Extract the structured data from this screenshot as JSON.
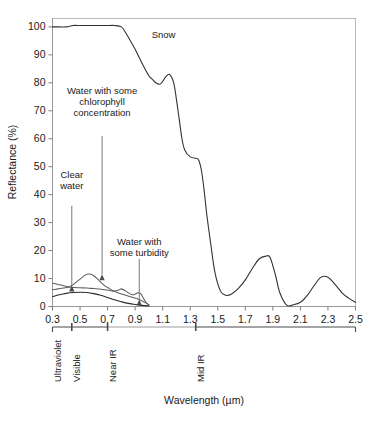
{
  "figure": {
    "background": "#ffffff",
    "ink": "#1a1a1a"
  },
  "axes": {
    "y_title": "Reflectance (%)",
    "x_title": "Wavelength (µm)",
    "y_ticks": [
      "0",
      "10",
      "20",
      "30",
      "40",
      "50",
      "60",
      "70",
      "80",
      "90",
      "100"
    ],
    "x_ticks": [
      "0.3",
      "0.5",
      "0.7",
      "0.9",
      "1.1",
      "1.3",
      "1.5",
      "1.7",
      "1.9",
      "2.1",
      "2.3",
      "2.5"
    ]
  },
  "bands": [
    {
      "label": "Ultraviolet",
      "start": 0.3,
      "end": 0.44
    },
    {
      "label": "Visible",
      "start": 0.44,
      "end": 0.7
    },
    {
      "label": "Near IR",
      "start": 0.7,
      "end": 1.34
    },
    {
      "label": "Mid IR",
      "start": 1.34,
      "end": 2.5
    }
  ],
  "annotations": [
    {
      "name": "snow-label",
      "lines": [
        "Snow"
      ],
      "x": 1.02,
      "y": 96,
      "anchor": "start",
      "arrow": false
    },
    {
      "name": "chlorophyll-label",
      "lines": [
        "Water with some",
        "chlorophyll",
        "concentration"
      ],
      "x": 0.66,
      "y": 76,
      "anchor": "middle",
      "arrow": true,
      "arrow_from": {
        "x": 0.66,
        "y": 61
      },
      "arrow_to": {
        "x": 0.66,
        "y": 11.5
      }
    },
    {
      "name": "clear-water-label",
      "lines": [
        "Clear",
        "water"
      ],
      "x": 0.44,
      "y": 46,
      "anchor": "middle",
      "arrow": true,
      "arrow_from": {
        "x": 0.44,
        "y": 36
      },
      "arrow_to": {
        "x": 0.44,
        "y": 7.5
      }
    },
    {
      "name": "turbidity-label",
      "lines": [
        "Water with",
        "some turbidity"
      ],
      "x": 0.93,
      "y": 22,
      "anchor": "middle",
      "arrow": true,
      "arrow_from": {
        "x": 0.93,
        "y": 17
      },
      "arrow_to": {
        "x": 0.93,
        "y": 2.5
      }
    }
  ],
  "chart_data": {
    "type": "line",
    "title": "",
    "xlabel": "Wavelength (µm)",
    "ylabel": "Reflectance (%)",
    "xlim": [
      0.3,
      2.5
    ],
    "ylim": [
      0,
      103
    ],
    "grid": false,
    "legend": "none (curves labelled in-plot with arrows)",
    "series": [
      {
        "name": "Snow",
        "color": "#333333",
        "x": [
          0.3,
          0.35,
          0.4,
          0.45,
          0.5,
          0.55,
          0.6,
          0.65,
          0.7,
          0.75,
          0.8,
          0.83,
          0.86,
          0.9,
          0.95,
          1.0,
          1.02,
          1.05,
          1.08,
          1.1,
          1.12,
          1.15,
          1.18,
          1.2,
          1.22,
          1.24,
          1.26,
          1.3,
          1.34,
          1.36,
          1.38,
          1.4,
          1.42,
          1.45,
          1.48,
          1.52,
          1.56,
          1.6,
          1.65,
          1.7,
          1.75,
          1.8,
          1.85,
          1.88,
          1.92,
          1.95,
          2.0,
          2.05,
          2.1,
          2.15,
          2.2,
          2.25,
          2.3,
          2.35,
          2.4,
          2.45,
          2.5
        ],
        "y": [
          100,
          100,
          100,
          100.5,
          100.5,
          100.5,
          100.5,
          100.5,
          100.5,
          100.5,
          100,
          98,
          95.5,
          92,
          87,
          82.5,
          81.5,
          80,
          79.5,
          80.5,
          82,
          83,
          80,
          74,
          67,
          60,
          56,
          53.5,
          53,
          52.5,
          49,
          42,
          33,
          22,
          12,
          5.5,
          4,
          4.5,
          6.5,
          9.5,
          13.5,
          17,
          18,
          17.5,
          11,
          5,
          0.5,
          0.6,
          1.5,
          4,
          7.5,
          10.5,
          10.5,
          8,
          5,
          3,
          1.5
        ]
      },
      {
        "name": "Clear water",
        "color": "#2b2b2b",
        "x": [
          0.3,
          0.35,
          0.4,
          0.45,
          0.5,
          0.55,
          0.6,
          0.65,
          0.7,
          0.75,
          0.8,
          0.85,
          0.9,
          0.95,
          1.0
        ],
        "y": [
          3.5,
          4.2,
          4.7,
          5.0,
          5.1,
          5.0,
          4.6,
          4.0,
          3.2,
          2.4,
          1.7,
          1.1,
          0.7,
          0.4,
          0.2
        ]
      },
      {
        "name": "Water with some chlorophyll concentration",
        "color": "#6a6a6a",
        "x": [
          0.3,
          0.34,
          0.38,
          0.42,
          0.46,
          0.5,
          0.54,
          0.57,
          0.6,
          0.64,
          0.68,
          0.7,
          0.74,
          0.78,
          0.82,
          0.86,
          0.9,
          0.94,
          0.98,
          1.0
        ],
        "y": [
          6.0,
          6.3,
          6.6,
          7.0,
          8.2,
          9.8,
          11.3,
          11.6,
          11.0,
          9.2,
          7.4,
          6.8,
          5.6,
          4.8,
          4.2,
          3.6,
          3.0,
          2.2,
          1.2,
          0.6
        ]
      },
      {
        "name": "Water with some turbidity",
        "color": "#6a6a6a",
        "x": [
          0.3,
          0.34,
          0.38,
          0.42,
          0.46,
          0.5,
          0.55,
          0.6,
          0.65,
          0.7,
          0.74,
          0.78,
          0.8,
          0.83,
          0.86,
          0.88,
          0.9,
          0.92,
          0.94,
          0.96,
          0.98,
          1.0
        ],
        "y": [
          8.4,
          7.9,
          7.4,
          7.0,
          6.8,
          6.7,
          6.6,
          6.4,
          6.2,
          5.9,
          5.5,
          5.9,
          6.3,
          5.6,
          4.6,
          4.2,
          4.4,
          4.9,
          4.6,
          3.0,
          1.4,
          0.5
        ]
      }
    ]
  }
}
